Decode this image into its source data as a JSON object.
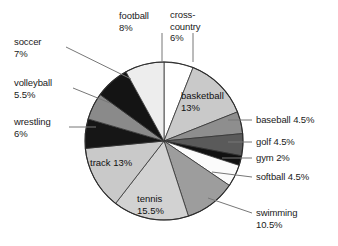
{
  "chart_data": {
    "type": "pie",
    "title": "",
    "subtitle": "",
    "xlabel": "",
    "ylabel": "",
    "legend_position": "none",
    "grid": false,
    "units": "percent",
    "total": 100,
    "start_angle_deg": 0,
    "direction": "clockwise",
    "categories": [
      "cross-country",
      "basketball",
      "baseball",
      "golf",
      "gym",
      "softball",
      "swimming",
      "tennis",
      "track",
      "wrestling",
      "volleyball",
      "soccer",
      "football"
    ],
    "values": [
      6,
      13,
      4.5,
      4.5,
      2,
      4.5,
      10.5,
      15.5,
      13,
      6,
      5.5,
      7,
      8
    ],
    "slices": [
      {
        "name": "cross-country",
        "value": 6,
        "label": "cross-\ncountry\n6%",
        "value_text": "6%",
        "color": "#ffffff",
        "label_placement": "outside-top",
        "leader": true
      },
      {
        "name": "basketball",
        "value": 13,
        "label": "basketball\n13%",
        "value_text": "13%",
        "color": "#c9c9c9",
        "label_placement": "inside",
        "leader": false
      },
      {
        "name": "baseball",
        "value": 4.5,
        "label": "baseball 4.5%",
        "value_text": "4.5%",
        "color": "#8e8e8e",
        "label_placement": "outside-right",
        "leader": true
      },
      {
        "name": "golf",
        "value": 4.5,
        "label": "golf 4.5%",
        "value_text": "4.5%",
        "color": "#5a5a5a",
        "label_placement": "outside-right",
        "leader": true
      },
      {
        "name": "gym",
        "value": 2,
        "label": "gym 2%",
        "value_text": "2%",
        "color": "#111111",
        "label_placement": "outside-right",
        "leader": true
      },
      {
        "name": "softball",
        "value": 4.5,
        "label": "softball 4.5%",
        "value_text": "4.5%",
        "color": "#fbfbfb",
        "label_placement": "outside-right",
        "leader": true
      },
      {
        "name": "swimming",
        "value": 10.5,
        "label": "swimming\n10.5%",
        "value_text": "10.5%",
        "color": "#9d9d9d",
        "label_placement": "outside-right",
        "leader": true
      },
      {
        "name": "tennis",
        "value": 15.5,
        "label": "tennis\n15.5%",
        "value_text": "15.5%",
        "color": "#d2d2d2",
        "label_placement": "inside",
        "leader": false
      },
      {
        "name": "track",
        "value": 13,
        "label": "track 13%",
        "value_text": "13%",
        "color": "#c9c9c9",
        "label_placement": "inside",
        "leader": false
      },
      {
        "name": "wrestling",
        "value": 6,
        "label": "wrestling\n6%",
        "value_text": "6%",
        "color": "#161616",
        "label_placement": "outside-left",
        "leader": true
      },
      {
        "name": "volleyball",
        "value": 5.5,
        "label": "volleyball\n5.5%",
        "value_text": "5.5%",
        "color": "#8a8a8a",
        "label_placement": "outside-left",
        "leader": true
      },
      {
        "name": "soccer",
        "value": 7,
        "label": "soccer\n7%",
        "value_text": "7%",
        "color": "#141414",
        "label_placement": "outside-left",
        "leader": true
      },
      {
        "name": "football",
        "value": 8,
        "label": "football\n8%",
        "value_text": "8%",
        "color": "#ededed",
        "label_placement": "outside-top",
        "leader": true
      }
    ]
  },
  "labels": {
    "football": "football\n8%",
    "cross_country": "cross-\ncountry\n6%",
    "soccer": "soccer\n7%",
    "volleyball": "volleyball\n5.5%",
    "wrestling": "wrestling\n6%",
    "baseball": "baseball 4.5%",
    "golf": "golf 4.5%",
    "gym": "gym 2%",
    "softball": "softball 4.5%",
    "swimming": "swimming\n10.5%",
    "basketball": "basketball\n13%",
    "tennis": "tennis\n15.5%",
    "track": "track 13%"
  },
  "style": {
    "background": "#ffffff",
    "outline": "#333333",
    "leader_color": "#777777",
    "text_color": "#1a1a1a"
  }
}
